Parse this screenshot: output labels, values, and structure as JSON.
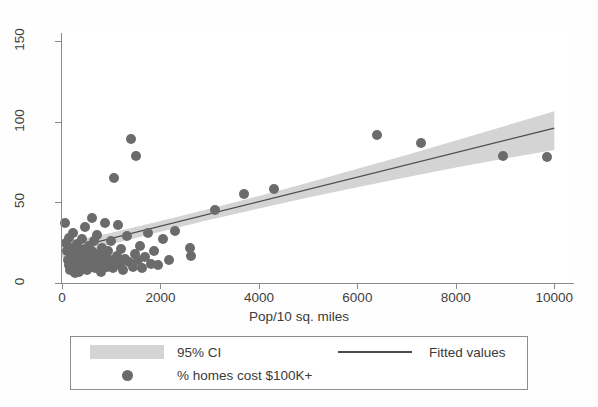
{
  "chart_data": {
    "type": "scatter",
    "title": "",
    "xlabel": "Pop/10 sq. miles",
    "ylabel": "",
    "xlim": [
      0,
      10400
    ],
    "ylim": [
      0,
      155
    ],
    "xticks": [
      0,
      2000,
      4000,
      6000,
      8000,
      10000
    ],
    "xtick_labels": [
      "0",
      "2000",
      "4000",
      "6000",
      "8000",
      "10000"
    ],
    "yticks": [
      0,
      50,
      100,
      150
    ],
    "ytick_labels": [
      "0",
      "50",
      "100",
      "150"
    ],
    "grid": false,
    "legend_position": "below-axes",
    "marker_color": "#6b6b6b",
    "line_color": "#4c4c4c",
    "ci_color": "#d4d4d4",
    "axis_color": "#8a8a8a",
    "series": [
      {
        "name": "% homes cost $100K+",
        "type": "scatter",
        "points": [
          [
            60,
            37
          ],
          [
            90,
            25
          ],
          [
            110,
            20
          ],
          [
            120,
            14
          ],
          [
            140,
            28
          ],
          [
            150,
            11
          ],
          [
            165,
            8
          ],
          [
            175,
            17
          ],
          [
            190,
            22
          ],
          [
            200,
            13
          ],
          [
            215,
            9
          ],
          [
            230,
            31
          ],
          [
            240,
            19
          ],
          [
            255,
            12
          ],
          [
            265,
            6
          ],
          [
            280,
            16
          ],
          [
            295,
            24
          ],
          [
            310,
            10
          ],
          [
            325,
            14
          ],
          [
            340,
            21
          ],
          [
            355,
            7
          ],
          [
            370,
            18
          ],
          [
            385,
            12
          ],
          [
            400,
            27
          ],
          [
            415,
            9
          ],
          [
            430,
            15
          ],
          [
            445,
            20
          ],
          [
            460,
            11
          ],
          [
            475,
            35
          ],
          [
            490,
            13
          ],
          [
            505,
            8
          ],
          [
            520,
            17
          ],
          [
            540,
            23
          ],
          [
            560,
            10
          ],
          [
            580,
            14
          ],
          [
            600,
            40
          ],
          [
            620,
            19
          ],
          [
            640,
            12
          ],
          [
            660,
            26
          ],
          [
            680,
            9
          ],
          [
            700,
            15
          ],
          [
            720,
            30
          ],
          [
            745,
            11
          ],
          [
            770,
            18
          ],
          [
            790,
            7
          ],
          [
            815,
            22
          ],
          [
            840,
            13
          ],
          [
            865,
            37
          ],
          [
            890,
            16
          ],
          [
            915,
            10
          ],
          [
            940,
            20
          ],
          [
            970,
            14
          ],
          [
            1000,
            26
          ],
          [
            1030,
            9
          ],
          [
            1050,
            65
          ],
          [
            1075,
            12
          ],
          [
            1110,
            17
          ],
          [
            1140,
            36
          ],
          [
            1170,
            11
          ],
          [
            1200,
            21
          ],
          [
            1240,
            8
          ],
          [
            1280,
            15
          ],
          [
            1320,
            29
          ],
          [
            1360,
            13
          ],
          [
            1400,
            89
          ],
          [
            1440,
            10
          ],
          [
            1480,
            18
          ],
          [
            1500,
            79
          ],
          [
            1540,
            14
          ],
          [
            1580,
            23
          ],
          [
            1620,
            9
          ],
          [
            1680,
            16
          ],
          [
            1740,
            31
          ],
          [
            1800,
            12
          ],
          [
            1860,
            20
          ],
          [
            1960,
            11
          ],
          [
            2060,
            27
          ],
          [
            2180,
            14
          ],
          [
            2300,
            32
          ],
          [
            2600,
            22
          ],
          [
            2620,
            17
          ],
          [
            3100,
            45
          ],
          [
            3700,
            55
          ],
          [
            4300,
            58
          ],
          [
            6400,
            92
          ],
          [
            7300,
            87
          ],
          [
            8950,
            79
          ],
          [
            9850,
            78
          ]
        ]
      },
      {
        "name": "Fitted values",
        "type": "line",
        "x": [
          0,
          10000
        ],
        "y": [
          20.0,
          96.0
        ]
      },
      {
        "name": "95% CI",
        "type": "band",
        "x": [
          0,
          1000,
          2000,
          3000,
          4000,
          5000,
          6000,
          7000,
          8000,
          9000,
          10000
        ],
        "lower": [
          15.5,
          24.0,
          31.8,
          39.2,
          46.2,
          53.0,
          59.4,
          65.6,
          71.6,
          77.2,
          82.5
        ],
        "upper": [
          24.5,
          31.2,
          38.4,
          46.0,
          54.0,
          62.2,
          70.8,
          79.4,
          88.4,
          97.4,
          106.5
        ]
      }
    ]
  },
  "legend": {
    "ci_label": "95% CI",
    "fitted_label": "Fitted values",
    "scatter_label": "% homes cost $100K+"
  }
}
